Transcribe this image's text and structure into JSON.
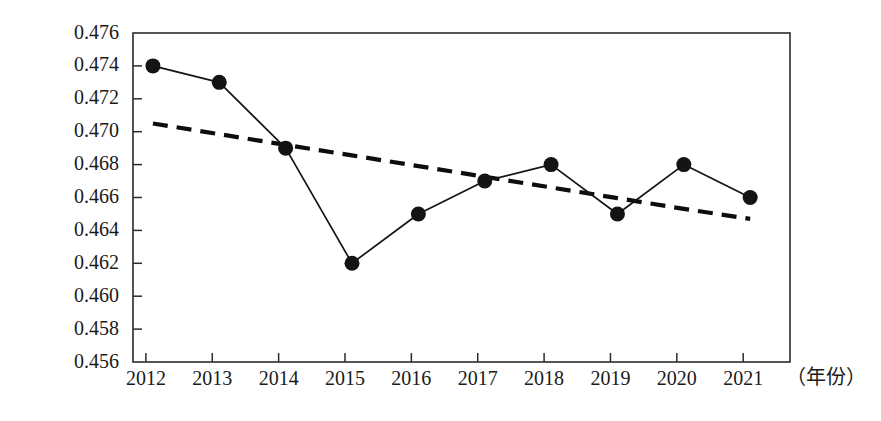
{
  "chart_data": {
    "type": "line",
    "title": "",
    "subtitle": "",
    "xlabel": "（年份）",
    "ylabel": "",
    "grid": false,
    "legend": null,
    "legend_position": "none",
    "categories": [
      "2012",
      "2013",
      "2014",
      "2015",
      "2016",
      "2017",
      "2018",
      "2019",
      "2020",
      "2021"
    ],
    "x": [
      2012,
      2013,
      2014,
      2015,
      2016,
      2017,
      2018,
      2019,
      2020,
      2021
    ],
    "xlim": [
      2011.7,
      2021.6
    ],
    "ylim": [
      0.456,
      0.476
    ],
    "ytick_labels": [
      "0.476",
      "0.474",
      "0.472",
      "0.470",
      "0.468",
      "0.466",
      "0.464",
      "0.462",
      "0.460",
      "0.458",
      "0.456"
    ],
    "ytick_values": [
      0.476,
      0.474,
      0.472,
      0.47,
      0.468,
      0.466,
      0.464,
      0.462,
      0.46,
      0.458,
      0.456
    ],
    "ytick_step": 0.002,
    "series": [
      {
        "name": "data-series",
        "style": "solid-with-markers",
        "marker": "filled-circle",
        "color": "#141414",
        "values": [
          0.474,
          0.473,
          0.469,
          0.462,
          0.465,
          0.467,
          0.468,
          0.465,
          0.468,
          0.466
        ]
      },
      {
        "name": "trend-line",
        "style": "dashed",
        "marker": "none",
        "color": "#0d0d0d",
        "values": [
          0.4705,
          0.46985,
          0.4692,
          0.46856,
          0.46791,
          0.46726,
          0.46661,
          0.46596,
          0.46531,
          0.4647
        ]
      }
    ],
    "annotations": []
  },
  "axis": {
    "x_unit_label": "（年份）"
  }
}
